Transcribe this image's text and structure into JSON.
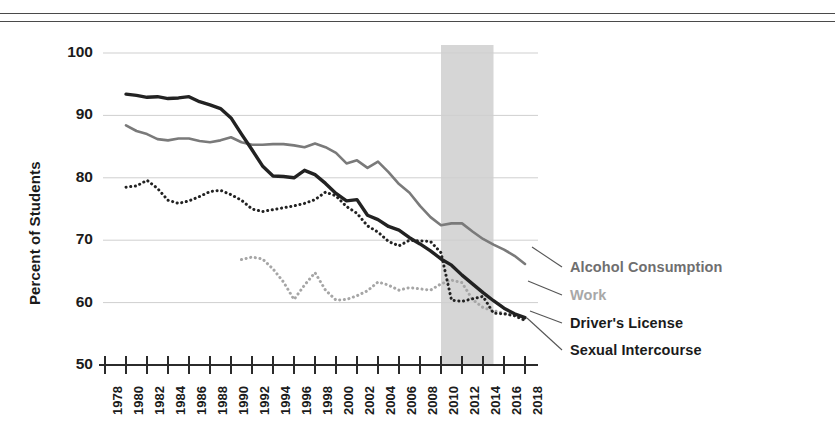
{
  "chart_data": {
    "type": "line",
    "title": "",
    "subtitle": "",
    "xlabel": "",
    "ylabel": "Percent of Students",
    "xlim": [
      1978,
      2018
    ],
    "ylim": [
      50,
      100
    ],
    "yticks": [
      50,
      60,
      70,
      80,
      90,
      100
    ],
    "xticks": [
      1978,
      1980,
      1982,
      1984,
      1986,
      1988,
      1990,
      1992,
      1994,
      1996,
      1998,
      2000,
      2002,
      2004,
      2006,
      2008,
      2010,
      2012,
      2014,
      2016,
      2018
    ],
    "grid": "horizontal",
    "legend_position": "right",
    "annotations": [
      {
        "type": "shaded-band",
        "label": "",
        "x_start": 2010,
        "x_end": 2015,
        "color": "#d6d6d6"
      }
    ],
    "series": [
      {
        "name": "Alcohol Consumption",
        "color": "#7a7a7a",
        "style": "solid",
        "x": [
          1980,
          1981,
          1982,
          1983,
          1984,
          1985,
          1986,
          1987,
          1988,
          1989,
          1990,
          1991,
          1992,
          1993,
          1994,
          1995,
          1996,
          1997,
          1998,
          1999,
          2000,
          2001,
          2002,
          2003,
          2004,
          2005,
          2006,
          2007,
          2008,
          2009,
          2010,
          2011,
          2012,
          2013,
          2014,
          2015,
          2016,
          2017,
          2018
        ],
        "values": [
          88.4,
          87.5,
          87.0,
          86.2,
          86.0,
          86.3,
          86.3,
          85.9,
          85.7,
          86.0,
          86.5,
          85.7,
          85.3,
          85.3,
          85.4,
          85.4,
          85.2,
          84.9,
          85.5,
          84.9,
          84.0,
          82.3,
          82.8,
          81.6,
          82.6,
          80.9,
          79.0,
          77.6,
          75.5,
          73.7,
          72.4,
          72.7,
          72.7,
          71.4,
          70.2,
          69.3,
          68.5,
          67.5,
          66.2
        ]
      },
      {
        "name": "Work",
        "color": "#a6a6a6",
        "style": "dotted",
        "x": [
          1991,
          1992,
          1993,
          1994,
          1995,
          1996,
          1997,
          1998,
          1999,
          2000,
          2001,
          2002,
          2003,
          2004,
          2005,
          2006,
          2007,
          2008,
          2009,
          2010,
          2011,
          2012,
          2013,
          2014,
          2015,
          2016,
          2017,
          2018
        ],
        "values": [
          66.9,
          67.3,
          67.0,
          65.4,
          63.3,
          60.5,
          62.8,
          64.8,
          62.0,
          60.4,
          60.5,
          61.1,
          61.9,
          63.3,
          62.8,
          62.0,
          62.4,
          62.2,
          62.0,
          63.0,
          63.6,
          63.2,
          60.5,
          59.2,
          58.7,
          58.3,
          57.9,
          57.1
        ]
      },
      {
        "name": "Driver's License",
        "color": "#222222",
        "style": "solid",
        "x": [
          1980,
          1981,
          1982,
          1983,
          1984,
          1985,
          1986,
          1987,
          1988,
          1989,
          1990,
          1991,
          1992,
          1993,
          1994,
          1995,
          1996,
          1997,
          1998,
          1999,
          2000,
          2001,
          2002,
          2003,
          2004,
          2005,
          2006,
          2007,
          2008,
          2009,
          2010,
          2011,
          2012,
          2013,
          2014,
          2015,
          2016,
          2017,
          2018
        ],
        "values": [
          93.4,
          93.2,
          92.9,
          93.0,
          92.7,
          92.8,
          93.0,
          92.2,
          91.7,
          91.1,
          89.6,
          87.0,
          84.5,
          81.9,
          80.3,
          80.2,
          80.0,
          81.2,
          80.5,
          79.1,
          77.5,
          76.3,
          76.5,
          74.0,
          73.3,
          72.2,
          71.6,
          70.4,
          69.4,
          68.3,
          67.0,
          66.0,
          64.4,
          63.0,
          61.6,
          60.3,
          59.1,
          58.2,
          57.6
        ]
      },
      {
        "name": "Sexual Intercourse",
        "color": "#222222",
        "style": "dotted",
        "x": [
          1980,
          1981,
          1982,
          1983,
          1984,
          1985,
          1986,
          1987,
          1988,
          1989,
          1990,
          1991,
          1992,
          1993,
          1994,
          1995,
          1996,
          1997,
          1998,
          1999,
          2000,
          2001,
          2002,
          2003,
          2004,
          2005,
          2006,
          2007,
          2008,
          2009,
          2010,
          2011,
          2012,
          2013,
          2014,
          2015,
          2016,
          2017,
          2018
        ],
        "values": [
          78.5,
          78.7,
          79.6,
          78.3,
          76.4,
          75.9,
          76.3,
          77.0,
          77.8,
          78.0,
          77.3,
          76.4,
          75.0,
          74.6,
          74.9,
          75.2,
          75.5,
          75.9,
          76.5,
          77.7,
          77.1,
          75.4,
          74.3,
          72.3,
          71.3,
          69.8,
          69.1,
          70.0,
          69.9,
          69.8,
          68.0,
          60.4,
          60.2,
          60.6,
          61.0,
          58.3,
          58.2,
          57.9,
          57.2
        ]
      }
    ]
  },
  "axis": {
    "ylabel": "Percent of Students"
  },
  "legend": {
    "items": [
      {
        "label": "Alcohol Consumption",
        "color": "#6f6f6f"
      },
      {
        "label": "Work",
        "color": "#a8a8a8"
      },
      {
        "label": "Driver's License",
        "color": "#1b1b1b"
      },
      {
        "label": "Sexual Intercourse",
        "color": "#1b1b1b"
      }
    ]
  }
}
